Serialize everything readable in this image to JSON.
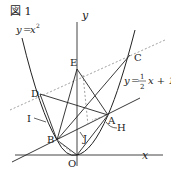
{
  "figure": {
    "title": "図 1",
    "parabola_label": "y = x²",
    "parabola_label_parts": {
      "lhs": "y",
      "eq": "=",
      "rhs": "x",
      "exp": "2"
    },
    "line_label_parts": {
      "lhs": "y",
      "eq": "=",
      "num": "1",
      "den": "2",
      "rest": "x + 1"
    },
    "axis_labels": {
      "x": "x",
      "y": "y",
      "origin": "O"
    },
    "points": {
      "A": "A",
      "B": "B",
      "C": "C",
      "D": "D",
      "E": "E",
      "H": "H",
      "I": "I",
      "J": "J"
    }
  },
  "colors": {
    "line": "#222222",
    "dashed": "#888888",
    "axis": "#444444"
  }
}
